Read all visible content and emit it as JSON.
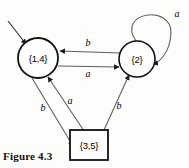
{
  "figure": {
    "caption": "Figure 4.3",
    "alphabet": [
      "a",
      "b"
    ]
  },
  "diagram": {
    "type": "finite-state-machine",
    "start_state": "{1,4}",
    "accepting_states": [
      "{3,5}"
    ],
    "states": [
      {
        "id": "s14",
        "label": "{1,4}",
        "shape": "circle",
        "cx": 38,
        "cy": 58,
        "r": 20,
        "is_start": true,
        "is_accepting": false
      },
      {
        "id": "s2",
        "label": "{2}",
        "shape": "circle",
        "cx": 137,
        "cy": 59,
        "r": 18,
        "is_start": false,
        "is_accepting": false
      },
      {
        "id": "s35",
        "label": "{3,5}",
        "shape": "square",
        "x": 70,
        "y": 130,
        "w": 38,
        "h": 30,
        "is_start": false,
        "is_accepting": true
      }
    ],
    "transitions": [
      {
        "from": "{2}",
        "to": "{1,4}",
        "symbol": "b",
        "label_x": 88,
        "label_y": 44
      },
      {
        "from": "{1,4}",
        "to": "{2}",
        "symbol": "a",
        "label_x": 88,
        "label_y": 74
      },
      {
        "from": "{2}",
        "to": "{2}",
        "symbol": "a",
        "label_x": 176,
        "label_y": 15,
        "self_loop": true
      },
      {
        "from": "{1,4}",
        "to": "{3,5}",
        "symbol": "b",
        "label_x": 43,
        "label_y": 109
      },
      {
        "from": "{3,5}",
        "to": "{1,4}",
        "symbol": "a",
        "label_x": 70,
        "label_y": 103
      },
      {
        "from": "{3,5}",
        "to": "{2}",
        "symbol": "b",
        "label_x": 118,
        "label_y": 108
      }
    ]
  },
  "colors": {
    "background": "#fdfdfb",
    "node_stroke": "#111111",
    "node_fill": "#ffffff",
    "edge_stroke": "#5f5f5f",
    "edge_stroke_dark": "#2b2b2b",
    "text": "#000000"
  }
}
